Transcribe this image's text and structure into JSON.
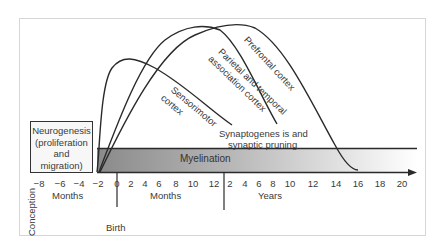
{
  "diagram": {
    "boxes": {
      "neurogenesis": [
        "Neurogenesis",
        "(proliferation",
        "and",
        "migration)"
      ],
      "myelination": "Myelination"
    },
    "curves": [
      {
        "name": "Sensorimotor cortex",
        "lines": [
          "Sensorimotor",
          "cortex"
        ]
      },
      {
        "name": "Parietal and temporal association cortex",
        "lines": [
          "Parietal and temporal",
          "association cortex"
        ]
      },
      {
        "name": "Prefrontal cortex",
        "lines": [
          "Prefrontal cortex"
        ]
      }
    ],
    "process_label": [
      "Synaptogenes is and",
      "synaptic pruning"
    ],
    "axis": {
      "prenatal_ticks": [
        "−8",
        "−6",
        "−4",
        "−2",
        "0"
      ],
      "month_ticks": [
        "2",
        "4",
        "6",
        "8",
        "10",
        "12"
      ],
      "year_ticks": [
        "2",
        "4",
        "6",
        "8",
        "10",
        "12",
        "14",
        "16",
        "18",
        "20"
      ],
      "prenatal_unit": "Months",
      "postnatal_month_unit": "Months",
      "year_unit": "Years"
    },
    "markers": {
      "conception": "Conception",
      "birth": "Birth"
    },
    "colors": {
      "line": "#2a2a2a",
      "bar_dark": "#8a8a8a",
      "bar_light": "#ffffff",
      "frame": "#d6d6d6"
    }
  }
}
